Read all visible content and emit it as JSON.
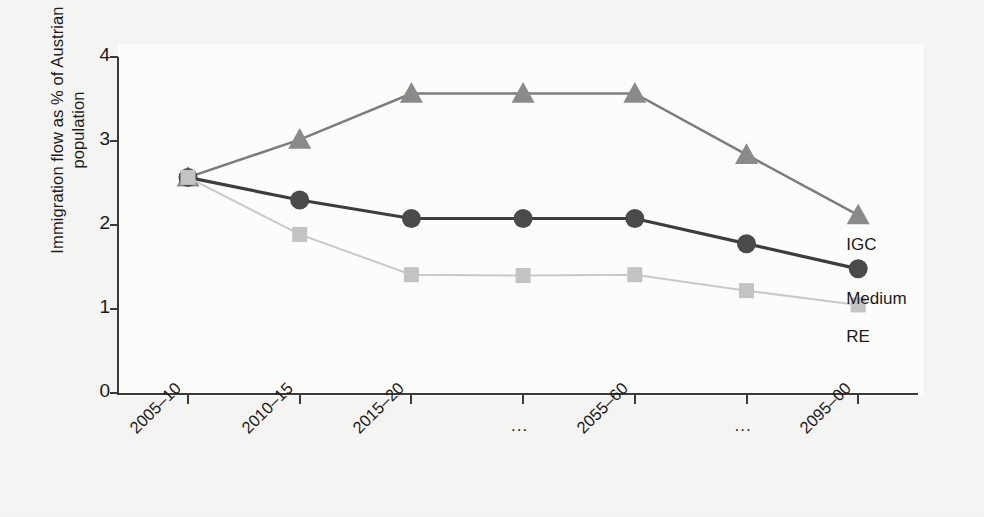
{
  "chart_data": {
    "type": "line",
    "title": "",
    "subtitle": "",
    "xlabel": "",
    "ylabel": "Immigration flow as % of Austrian population",
    "categories": [
      "2005–10",
      "2010–15",
      "2015–20",
      "...",
      "2055–60",
      "...",
      "2095–00"
    ],
    "ylim": [
      0,
      4
    ],
    "yticks": [
      0,
      1,
      2,
      3,
      4
    ],
    "ytick_labels": [
      "0",
      "1",
      "2",
      "3",
      "4"
    ],
    "grid": false,
    "legend_position": "inline-right-end-of-series",
    "series": [
      {
        "name": "IGC",
        "marker": "triangle",
        "color": "#8a8a8a",
        "line_color": "#7d7d7d",
        "values": [
          2.57,
          3.02,
          3.57,
          3.57,
          3.57,
          2.84,
          2.12
        ]
      },
      {
        "name": "Medium",
        "marker": "circle",
        "color": "#4a4a4a",
        "line_color": "#3d3d3d",
        "values": [
          2.57,
          2.3,
          2.08,
          2.08,
          2.08,
          1.78,
          1.48
        ]
      },
      {
        "name": "RE",
        "marker": "square",
        "color": "#c3c3c3",
        "line_color": "#c9c9c9",
        "values": [
          2.57,
          1.89,
          1.41,
          1.4,
          1.41,
          1.22,
          1.05
        ]
      }
    ]
  },
  "figure": {
    "background_color": "#f7f7f5",
    "plot_background_color": "#fcfcfb",
    "axis_color": "#3a3a3a"
  },
  "series_labels": {
    "igc": "IGC",
    "medium": "Medium",
    "re": "RE"
  }
}
